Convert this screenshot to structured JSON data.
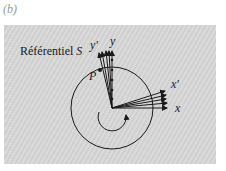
{
  "figure": {
    "label": "(b)",
    "frame_title": "Référentiel",
    "frame_symbol": "S",
    "labels": {
      "y_prime": "y′",
      "y": "y",
      "x_prime": "x′",
      "x": "x",
      "point": "P"
    },
    "colors": {
      "panel": "#d6d6d6",
      "ink": "#1a1a1a",
      "figure_label": "#9a9a9a"
    },
    "geometry": {
      "origin": [
        112,
        108
      ],
      "circle_radius": 41,
      "vector_count_per_axis": 5,
      "rotation_direction": "counterclockwise-arrow"
    }
  }
}
